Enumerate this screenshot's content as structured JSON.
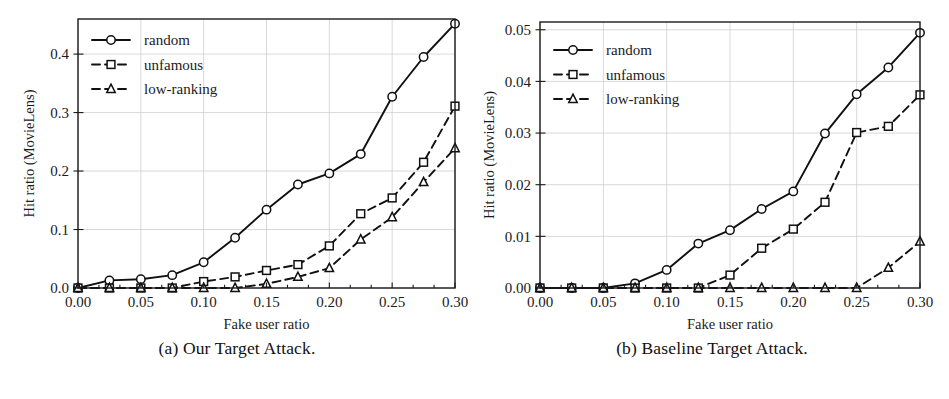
{
  "figure": {
    "panels": [
      {
        "id": "a",
        "caption": "(a) Our Target Attack."
      },
      {
        "id": "b",
        "caption": "(b) Baseline Target Attack."
      }
    ]
  },
  "chart_data": [
    {
      "type": "line",
      "panel": "a",
      "title": "(a) Our Target Attack.",
      "xlabel": "Fake user ratio",
      "ylabel": "Hit ratio (MovieLens)",
      "xlim": [
        0.0,
        0.3
      ],
      "ylim": [
        0.0,
        0.46
      ],
      "xticks": [
        0.0,
        0.05,
        0.1,
        0.15,
        0.2,
        0.25,
        0.3
      ],
      "xticklabels": [
        "0.00",
        "0.05",
        "0.10",
        "0.15",
        "0.20",
        "0.25",
        "0.30"
      ],
      "yticks": [
        0.0,
        0.1,
        0.2,
        0.3,
        0.4
      ],
      "yticklabels": [
        "0.0",
        "0.1",
        "0.2",
        "0.3",
        "0.4"
      ],
      "grid": true,
      "legend_position": "upper left",
      "x": [
        0.0,
        0.025,
        0.05,
        0.075,
        0.1,
        0.125,
        0.15,
        0.175,
        0.2,
        0.225,
        0.25,
        0.275,
        0.3
      ],
      "series": [
        {
          "name": "random",
          "style": "solid",
          "marker": "circle",
          "values": [
            0.0,
            0.013,
            0.015,
            0.022,
            0.044,
            0.086,
            0.134,
            0.177,
            0.196,
            0.229,
            0.327,
            0.395,
            0.452
          ]
        },
        {
          "name": "unfamous",
          "style": "dashed",
          "marker": "square",
          "values": [
            0.0,
            0.0,
            0.0,
            0.0,
            0.011,
            0.019,
            0.03,
            0.04,
            0.072,
            0.127,
            0.154,
            0.215,
            0.311
          ]
        },
        {
          "name": "low-ranking",
          "style": "dashed",
          "marker": "triangle",
          "values": [
            0.0,
            0.0,
            0.0,
            0.0,
            0.0,
            0.0,
            0.007,
            0.019,
            0.034,
            0.083,
            0.121,
            0.181,
            0.239
          ]
        }
      ]
    },
    {
      "type": "line",
      "panel": "b",
      "title": "(b) Baseline Target Attack.",
      "xlabel": "Fake user ratio",
      "ylabel": "Hit ratio (MovieLens)",
      "xlim": [
        0.0,
        0.3
      ],
      "ylim": [
        0.0,
        0.0515
      ],
      "xticks": [
        0.0,
        0.05,
        0.1,
        0.15,
        0.2,
        0.25,
        0.3
      ],
      "xticklabels": [
        "0.00",
        "0.05",
        "0.10",
        "0.15",
        "0.20",
        "0.25",
        "0.30"
      ],
      "yticks": [
        0.0,
        0.01,
        0.02,
        0.03,
        0.04,
        0.05
      ],
      "yticklabels": [
        "0.00",
        "0.01",
        "0.02",
        "0.03",
        "0.04",
        "0.05"
      ],
      "grid": true,
      "legend_position": "upper left",
      "x": [
        0.0,
        0.025,
        0.05,
        0.075,
        0.1,
        0.125,
        0.15,
        0.175,
        0.2,
        0.225,
        0.25,
        0.275,
        0.3
      ],
      "series": [
        {
          "name": "random",
          "style": "solid",
          "marker": "circle",
          "values": [
            0.0,
            0.0,
            0.0,
            0.0009,
            0.0035,
            0.0086,
            0.0112,
            0.0153,
            0.0187,
            0.0299,
            0.0375,
            0.0427,
            0.0494
          ]
        },
        {
          "name": "unfamous",
          "style": "dashed",
          "marker": "square",
          "values": [
            0.0,
            0.0,
            0.0,
            0.0,
            0.0,
            0.0,
            0.0025,
            0.0077,
            0.0114,
            0.0166,
            0.0301,
            0.0313,
            0.0374
          ]
        },
        {
          "name": "low-ranking",
          "style": "dashed",
          "marker": "triangle",
          "values": [
            0.0,
            0.0,
            0.0,
            0.0,
            0.0,
            0.0,
            0.0,
            0.0,
            0.0,
            0.0,
            0.0,
            0.0039,
            0.009
          ]
        }
      ]
    }
  ]
}
